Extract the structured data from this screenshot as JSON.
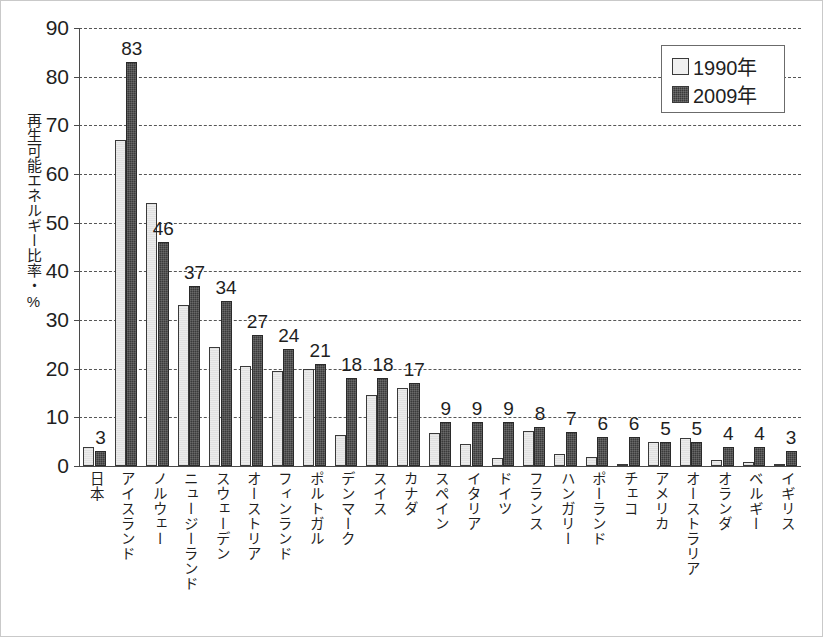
{
  "chart_data": {
    "type": "bar",
    "title": "",
    "xlabel": "",
    "ylabel": "再生可能エネルギー比率・%",
    "ylim": [
      0,
      90
    ],
    "yticks": [
      0,
      10,
      20,
      30,
      40,
      50,
      60,
      70,
      80,
      90
    ],
    "grid": true,
    "legend_position": "top-right",
    "categories": [
      "日本",
      "アイスランド",
      "ノルウェー",
      "ニュージーランド",
      "スウェーデン",
      "オーストリア",
      "フィンランド",
      "ポルトガル",
      "デンマーク",
      "スイス",
      "カナダ",
      "スペイン",
      "イタリア",
      "ドイツ",
      "フランス",
      "ハンガリー",
      "ポーランド",
      "チェコ",
      "アメリカ",
      "オーストラリア",
      "オランダ",
      "ベルギー",
      "イギリス"
    ],
    "series": [
      {
        "name": "1990年",
        "color": "#ececec",
        "values": [
          4.0,
          67.0,
          54.0,
          33.0,
          24.5,
          20.5,
          19.5,
          20.0,
          6.3,
          14.5,
          16.0,
          6.8,
          4.5,
          1.7,
          7.2,
          2.5,
          1.8,
          0.5,
          5.0,
          5.7,
          1.2,
          0.8,
          0.4
        ],
        "labels": [
          "",
          "",
          "",
          "",
          "",
          "",
          "",
          "",
          "",
          "",
          "",
          "",
          "",
          "",
          "",
          "",
          "",
          "",
          "",
          "",
          "",
          "",
          ""
        ]
      },
      {
        "name": "2009年",
        "color": "#3a3a3a",
        "values": [
          3,
          83,
          46,
          37,
          34,
          27,
          24,
          21,
          18,
          18,
          17,
          9,
          9,
          9,
          8,
          7,
          6,
          6,
          5,
          5,
          4,
          4,
          3
        ],
        "labels": [
          "3",
          "83",
          "46",
          "37",
          "34",
          "27",
          "24",
          "21",
          "18",
          "18",
          "17",
          "9",
          "9",
          "9",
          "8",
          "7",
          "6",
          "6",
          "5",
          "5",
          "4",
          "4",
          "3"
        ]
      }
    ]
  },
  "legend": {
    "items": [
      {
        "label": "1990年",
        "swatch": "light-square-swatch"
      },
      {
        "label": "2009年",
        "swatch": "dark-square-swatch"
      }
    ]
  }
}
